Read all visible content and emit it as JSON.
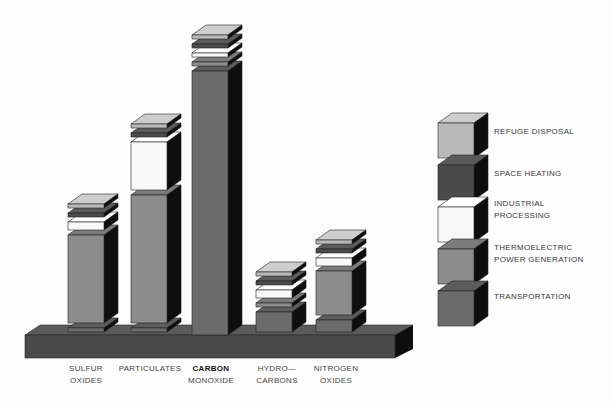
{
  "chart_data": {
    "type": "bar",
    "stacked": true,
    "style": "3d exploded stacked columns",
    "title": "",
    "xlabel": "",
    "ylabel": "",
    "units": "relative (no value axis shown)",
    "grid": false,
    "legend_position": "right",
    "categories": [
      "SULFUR OXIDES",
      "PARTICULATES",
      "CARBON MONOXIDE",
      "HYDROCARBONS",
      "NITROGEN OXIDES"
    ],
    "category_labels": [
      [
        "SULFUR",
        "OXIDES"
      ],
      [
        "PARTICULATES",
        ""
      ],
      [
        "CARBON",
        "MONOXIDE"
      ],
      [
        "HYDRO—",
        "CARBONS"
      ],
      [
        "NITROGEN",
        "OXIDES"
      ]
    ],
    "series": [
      {
        "name": "TRANSPORTATION",
        "color": "#6b6b6b",
        "top": "#5c5c5c",
        "values": [
          1,
          1,
          66,
          5,
          3
        ]
      },
      {
        "name": "THERMOELECTRIC POWER GENERATION",
        "color": "#8c8c8c",
        "top": "#7b7b7b",
        "values": [
          22,
          32,
          1,
          1,
          11
        ]
      },
      {
        "name": "INDUSTRIAL PROCESSING",
        "color": "#f8f8f8",
        "top": "#ffffff",
        "values": [
          2,
          12,
          1,
          2,
          2
        ]
      },
      {
        "name": "SPACE HEATING",
        "color": "#4b4b4b",
        "top": "#5a5a5a",
        "values": [
          1,
          1,
          1,
          1,
          1
        ]
      },
      {
        "name": "REFUGE DISPOSAL",
        "color": "#b9b9b9",
        "top": "#cdcdcd",
        "values": [
          1,
          1,
          1,
          1,
          1
        ]
      }
    ],
    "legend": [
      {
        "lines": [
          "REFUGE DISPOSAL"
        ],
        "series_index": 4
      },
      {
        "lines": [
          "SPACE HEATING"
        ],
        "series_index": 3
      },
      {
        "lines": [
          "INDUSTRIAL",
          "PROCESSING"
        ],
        "series_index": 2
      },
      {
        "lines": [
          "THERMOELECTRIC",
          "POWER GENERATION"
        ],
        "series_index": 1
      },
      {
        "lines": [
          "TRANSPORTATION"
        ],
        "series_index": 0
      }
    ]
  },
  "colors": {
    "base_front": "#4a4a4a",
    "base_top": "#5b5b5b",
    "side": "#0e0e0e",
    "outline": "#222222"
  }
}
